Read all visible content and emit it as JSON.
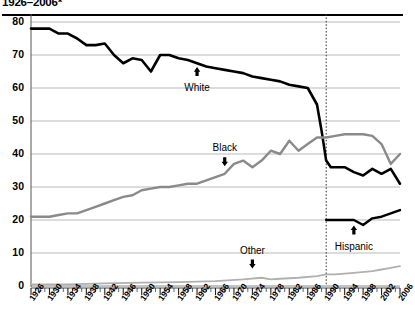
{
  "title": "1926–2006*",
  "chart_data": {
    "type": "line",
    "title": "1926–2006*",
    "xlabel": "",
    "ylabel": "",
    "xlim": [
      1926,
      2006
    ],
    "ylim": [
      0,
      80
    ],
    "yticks": [
      0,
      10,
      20,
      30,
      40,
      50,
      60,
      70,
      80
    ],
    "xticks": [
      1926,
      1930,
      1934,
      1938,
      1942,
      1946,
      1950,
      1954,
      1958,
      1962,
      1966,
      1970,
      1974,
      1978,
      1982,
      1986,
      1990,
      1994,
      1998,
      2002,
      2006
    ],
    "grid": true,
    "legend_position": "inline-annotations",
    "annotations": [
      {
        "text": "White",
        "x": 1962,
        "y": 63,
        "arrow": "up"
      },
      {
        "text": "Black",
        "x": 1968,
        "y": 39,
        "arrow": "down"
      },
      {
        "text": "Hispanic",
        "x": 1996,
        "y": 15,
        "arrow": "up"
      },
      {
        "text": "Other",
        "x": 1974,
        "y": 8,
        "arrow": "down"
      }
    ],
    "reference_line": {
      "x": 1990,
      "style": "dotted",
      "note": "series break"
    },
    "series": [
      {
        "name": "White",
        "color": "#000000",
        "x": [
          1926,
          1928,
          1930,
          1932,
          1934,
          1936,
          1938,
          1940,
          1942,
          1944,
          1946,
          1948,
          1950,
          1952,
          1954,
          1956,
          1958,
          1960,
          1962,
          1964,
          1966,
          1968,
          1970,
          1972,
          1974,
          1976,
          1978,
          1980,
          1982,
          1984,
          1986,
          1988,
          1989,
          1990,
          1991,
          1992,
          1994,
          1996,
          1998,
          2000,
          2002,
          2004,
          2006
        ],
        "values": [
          78,
          78,
          78,
          76.5,
          76.5,
          75,
          73,
          73,
          73.5,
          70,
          67.5,
          69,
          68.5,
          65,
          70,
          70,
          69,
          68.5,
          67.5,
          66.5,
          66,
          65.5,
          65,
          64.5,
          63.5,
          63,
          62.5,
          62,
          61,
          60.5,
          60,
          55,
          47,
          38,
          36,
          36,
          36,
          34.5,
          33.5,
          35.5,
          34,
          35.5,
          31
        ]
      },
      {
        "name": "Black",
        "color": "#8a8a8a",
        "x": [
          1926,
          1928,
          1930,
          1932,
          1934,
          1936,
          1938,
          1940,
          1942,
          1944,
          1946,
          1948,
          1950,
          1952,
          1954,
          1956,
          1958,
          1960,
          1962,
          1964,
          1966,
          1968,
          1970,
          1972,
          1974,
          1976,
          1978,
          1980,
          1982,
          1984,
          1986,
          1988,
          1990,
          1992,
          1994,
          1996,
          1998,
          2000,
          2002,
          2004,
          2006
        ],
        "values": [
          21,
          21,
          21,
          21.5,
          22,
          22,
          23,
          24,
          25,
          26,
          27,
          27.5,
          29,
          29.5,
          30,
          30,
          30.5,
          31,
          31,
          32,
          33,
          34,
          37,
          38,
          36,
          38,
          41,
          40,
          44,
          41,
          43,
          45,
          45,
          45.5,
          46,
          46,
          46,
          45.5,
          43,
          37,
          40
        ]
      },
      {
        "name": "Hispanic",
        "color": "#000000",
        "x": [
          1990,
          1992,
          1994,
          1996,
          1998,
          2000,
          2002,
          2004,
          2006
        ],
        "values": [
          20,
          20,
          20,
          20,
          18.5,
          20.5,
          21,
          22,
          23
        ]
      },
      {
        "name": "Other",
        "color": "#b0b0b0",
        "x": [
          1926,
          1934,
          1942,
          1950,
          1958,
          1966,
          1972,
          1976,
          1978,
          1980,
          1984,
          1988,
          1990,
          1992,
          1996,
          2000,
          2002,
          2004,
          2006
        ],
        "values": [
          0.5,
          0.5,
          0.8,
          1,
          1.2,
          1.5,
          2,
          2.5,
          2,
          2.2,
          2.5,
          3,
          3.5,
          3.5,
          4,
          4.5,
          5,
          5.5,
          6
        ]
      }
    ]
  }
}
